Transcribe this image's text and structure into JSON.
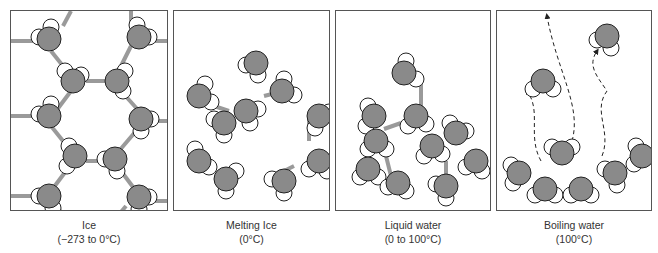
{
  "figure": {
    "panels": [
      {
        "id": "ice",
        "title": "Ice",
        "range": "(−273 to 0°C)"
      },
      {
        "id": "melting-ice",
        "title": "Melting Ice",
        "range": "(0°C)"
      },
      {
        "id": "liquid-water",
        "title": "Liquid water",
        "range": "(0 to 100°C)"
      },
      {
        "id": "boiling-water",
        "title": "Boiling water",
        "range": "(100°C)"
      }
    ],
    "colors": {
      "oxygen": "#8a8a8a",
      "hydrogen": "#ffffff",
      "hydrogen_bond": "#9a9a9a",
      "outline": "#222222",
      "frame": "#555555"
    }
  }
}
